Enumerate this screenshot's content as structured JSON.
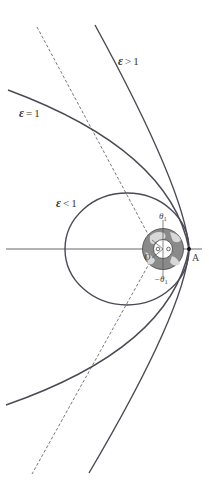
{
  "diagram": {
    "type": "orbit-trajectories",
    "curves": [
      {
        "id": "hyperbola",
        "eps_symbol": "ε",
        "relation": ">",
        "value": "1"
      },
      {
        "id": "parabola",
        "eps_symbol": "ε",
        "relation": "=",
        "value": "1"
      },
      {
        "id": "ellipse",
        "eps_symbol": "ε",
        "relation": "<",
        "value": "1"
      }
    ],
    "labels": {
      "point_a": "A",
      "center": "O",
      "theta_upper": "θ",
      "theta_upper_sub": "1",
      "theta_lower": "−θ",
      "theta_lower_sub": "1"
    },
    "colors": {
      "curve": "#4a4a55",
      "earth_fill": "#8a8a8a",
      "earth_land": "#d8d8d8"
    }
  }
}
